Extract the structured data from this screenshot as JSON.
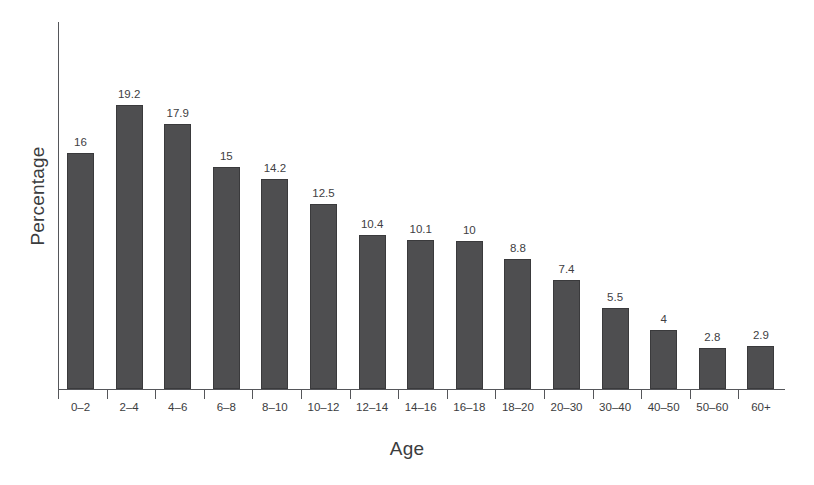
{
  "chart_data": {
    "type": "bar",
    "title": "",
    "xlabel": "Age",
    "ylabel": "Percentage",
    "categories": [
      "0–2",
      "2–4",
      "4–6",
      "6–8",
      "8–10",
      "10–12",
      "12–14",
      "14–16",
      "16–18",
      "18–20",
      "20–30",
      "30–40",
      "40–50",
      "50–60",
      "60+"
    ],
    "values": [
      16,
      19.2,
      17.9,
      15,
      14.2,
      12.5,
      10.4,
      10.1,
      10,
      8.8,
      7.4,
      5.5,
      4,
      2.8,
      2.9
    ],
    "value_labels": [
      "16",
      "19.2",
      "17.9",
      "15",
      "14.2",
      "12.5",
      "10.4",
      "10.1",
      "10",
      "8.8",
      "7.4",
      "5.5",
      "4",
      "2.8",
      "2.9"
    ],
    "ylim": [
      0,
      19.2
    ],
    "grid": false,
    "legend": "none",
    "bar_color": "#4e4e50",
    "axis_color": "#55565a",
    "text_color": "#3b3c3e",
    "background_color": "#ffffff"
  }
}
